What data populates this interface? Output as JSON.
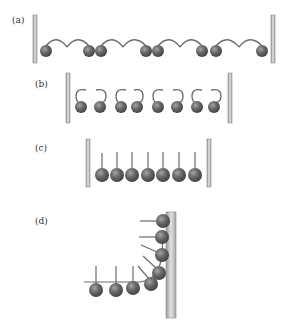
{
  "figure": {
    "panels": [
      {
        "id": "a",
        "label": "(a)",
        "description": "Chain of spheres with curved hooks between two walls"
      },
      {
        "id": "b",
        "label": "(b)",
        "description": "Spheres with curled hooks paired between two walls"
      },
      {
        "id": "c",
        "label": "(c)",
        "description": "Row of spheres with vertical stems between two walls"
      },
      {
        "id": "d",
        "label": "(d)",
        "description": "Spheres with stems bending around a corner against a single wall"
      }
    ],
    "colors": {
      "ball": "#5f5f5f",
      "ball_highlight": "#9a9a9a",
      "wall": "#c8c8c8",
      "stroke": "#6b6b6b"
    },
    "counts": {
      "a_balls": 8,
      "b_balls": 8,
      "c_balls": 7,
      "d_balls": 8
    }
  }
}
